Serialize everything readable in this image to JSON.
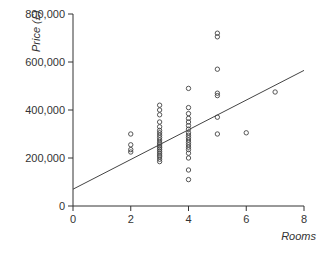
{
  "chart_data": {
    "type": "scatter",
    "title": "",
    "xlabel": "Rooms",
    "ylabel": "Price (£)",
    "xlim": [
      0,
      8
    ],
    "ylim": [
      0,
      800000
    ],
    "x_ticks": [
      0,
      2,
      4,
      6,
      8
    ],
    "x_tick_labels": [
      "0",
      "2",
      "4",
      "6",
      "8"
    ],
    "y_ticks": [
      0,
      200000,
      400000,
      600000,
      800000
    ],
    "y_tick_labels": [
      "0",
      "200,000",
      "400,000",
      "600,000",
      "800,000"
    ],
    "grid": false,
    "legend": null,
    "marker": "open-circle",
    "series": [
      {
        "name": "Houses",
        "points": [
          {
            "x": 2,
            "y": 300000
          },
          {
            "x": 2,
            "y": 255000
          },
          {
            "x": 2,
            "y": 235000
          },
          {
            "x": 2,
            "y": 225000
          },
          {
            "x": 3,
            "y": 420000
          },
          {
            "x": 3,
            "y": 400000
          },
          {
            "x": 3,
            "y": 380000
          },
          {
            "x": 3,
            "y": 350000
          },
          {
            "x": 3,
            "y": 330000
          },
          {
            "x": 3,
            "y": 315000
          },
          {
            "x": 3,
            "y": 305000
          },
          {
            "x": 3,
            "y": 295000
          },
          {
            "x": 3,
            "y": 285000
          },
          {
            "x": 3,
            "y": 275000
          },
          {
            "x": 3,
            "y": 265000
          },
          {
            "x": 3,
            "y": 258000
          },
          {
            "x": 3,
            "y": 250000
          },
          {
            "x": 3,
            "y": 243000
          },
          {
            "x": 3,
            "y": 236000
          },
          {
            "x": 3,
            "y": 228000
          },
          {
            "x": 3,
            "y": 220000
          },
          {
            "x": 3,
            "y": 212000
          },
          {
            "x": 3,
            "y": 205000
          },
          {
            "x": 3,
            "y": 195000
          },
          {
            "x": 3,
            "y": 185000
          },
          {
            "x": 4,
            "y": 490000
          },
          {
            "x": 4,
            "y": 410000
          },
          {
            "x": 4,
            "y": 385000
          },
          {
            "x": 4,
            "y": 365000
          },
          {
            "x": 4,
            "y": 350000
          },
          {
            "x": 4,
            "y": 335000
          },
          {
            "x": 4,
            "y": 320000
          },
          {
            "x": 4,
            "y": 305000
          },
          {
            "x": 4,
            "y": 295000
          },
          {
            "x": 4,
            "y": 285000
          },
          {
            "x": 4,
            "y": 275000
          },
          {
            "x": 4,
            "y": 265000
          },
          {
            "x": 4,
            "y": 255000
          },
          {
            "x": 4,
            "y": 245000
          },
          {
            "x": 4,
            "y": 235000
          },
          {
            "x": 4,
            "y": 220000
          },
          {
            "x": 4,
            "y": 200000
          },
          {
            "x": 4,
            "y": 150000
          },
          {
            "x": 4,
            "y": 110000
          },
          {
            "x": 5,
            "y": 720000
          },
          {
            "x": 5,
            "y": 705000
          },
          {
            "x": 5,
            "y": 570000
          },
          {
            "x": 5,
            "y": 470000
          },
          {
            "x": 5,
            "y": 460000
          },
          {
            "x": 5,
            "y": 370000
          },
          {
            "x": 5,
            "y": 300000
          },
          {
            "x": 6,
            "y": 305000
          },
          {
            "x": 7,
            "y": 475000
          }
        ]
      }
    ],
    "fit_line": {
      "type": "linear-regression",
      "x0": 0,
      "y0": 70000,
      "x1": 8,
      "y1": 565000
    }
  },
  "colors": {
    "axis": "#333333",
    "marker": "#444444",
    "line": "#444444",
    "background": "#ffffff"
  }
}
